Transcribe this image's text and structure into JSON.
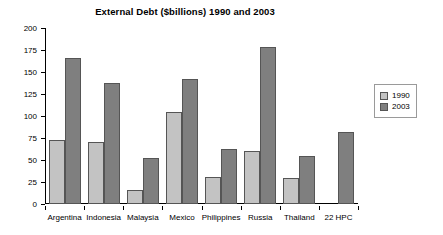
{
  "chart_data": {
    "type": "bar",
    "title": "External Debt ($billions) 1990 and 2003",
    "xlabel": "",
    "ylabel": "",
    "ylim": [
      0,
      200
    ],
    "yticks": [
      0,
      25,
      50,
      75,
      100,
      125,
      150,
      175,
      200
    ],
    "grid": false,
    "legend_position": "right",
    "categories": [
      "Argentina",
      "Indonesia",
      "Malaysia",
      "Mexico",
      "Philippines",
      "Russia",
      "Thailand",
      "22 HPC"
    ],
    "series": [
      {
        "name": "1990",
        "color": "#c3c3c3",
        "values": [
          73,
          70,
          16,
          105,
          31,
          60,
          29,
          null
        ]
      },
      {
        "name": "2003",
        "color": "#7f7f7f",
        "values": [
          166,
          138,
          52,
          142,
          63,
          178,
          55,
          82
        ]
      }
    ]
  },
  "legend": {
    "entries": [
      {
        "label": "1990"
      },
      {
        "label": "2003"
      }
    ]
  }
}
